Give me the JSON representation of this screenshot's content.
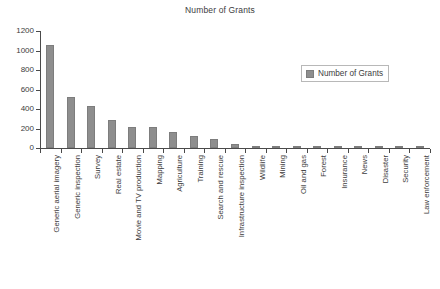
{
  "chart_data": {
    "type": "bar",
    "title": "Number of Grants",
    "xlabel": "",
    "ylabel": "",
    "ylim": [
      0,
      1200
    ],
    "yticks": [
      0,
      200,
      400,
      600,
      800,
      1000,
      1200
    ],
    "grid": false,
    "legend_position": "top-right",
    "legend": [
      "Number of Grants"
    ],
    "series_name": "Number of Grants",
    "bar_color": "#8e8e8e",
    "axis_color": "#4a4a4a",
    "categories": [
      "Generic aerial imagery",
      "Generic inspection",
      "Survey",
      "Real estate",
      "Movie and TV production",
      "Mapping",
      "Agriculture",
      "Training",
      "Search and rescue",
      "Infrastructure inspection",
      "Wildlife",
      "Mining",
      "Oil and gas",
      "Forest",
      "Insurance",
      "News",
      "Disaster",
      "Security",
      "Law enforcement"
    ],
    "values": [
      1055,
      520,
      435,
      290,
      220,
      215,
      165,
      125,
      95,
      40,
      22,
      18,
      15,
      14,
      12,
      10,
      8,
      6,
      4
    ]
  }
}
